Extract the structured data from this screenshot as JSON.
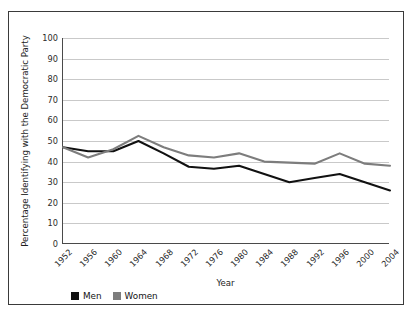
{
  "chart_data": {
    "type": "line",
    "title": "",
    "xlabel": "Year",
    "ylabel": "Percentage Identifying with the Democratic Party",
    "categories": [
      "1952",
      "1956",
      "1960",
      "1964",
      "1968",
      "1972",
      "1976",
      "1980",
      "1984",
      "1988",
      "1992",
      "1996",
      "2000",
      "2004"
    ],
    "x": [
      1952,
      1956,
      1960,
      1964,
      1968,
      1972,
      1976,
      1980,
      1984,
      1988,
      1992,
      1996,
      2000,
      2004
    ],
    "ylim": [
      0,
      100
    ],
    "yticks": [
      0,
      10,
      20,
      30,
      40,
      50,
      60,
      70,
      80,
      90,
      100
    ],
    "ytick_labels": [
      "0",
      "10",
      "20",
      "30",
      "40",
      "50",
      "60",
      "70",
      "80",
      "90",
      "100"
    ],
    "grid": "horizontal",
    "legend_position": "below-axes-left",
    "series": [
      {
        "name": "Men",
        "color": "#111111",
        "values": [
          47,
          45,
          45,
          50,
          44,
          37.5,
          36.5,
          38,
          34,
          30,
          32,
          34,
          30,
          26
        ]
      },
      {
        "name": "Women",
        "color": "#7d7d7d",
        "values": [
          47,
          42,
          46,
          52.5,
          47,
          43,
          42,
          44,
          40,
          39.5,
          39,
          44,
          39,
          38
        ]
      }
    ]
  },
  "legend": {
    "items": [
      {
        "label": "Men",
        "color": "#111111"
      },
      {
        "label": "Women",
        "color": "#7d7d7d"
      }
    ]
  },
  "colors": {
    "men": "#111111",
    "women": "#7d7d7d",
    "grid": "#c9c9c9",
    "axis": "#4a4a4a",
    "frame": "#3a3a3a",
    "background": "#ffffff"
  }
}
